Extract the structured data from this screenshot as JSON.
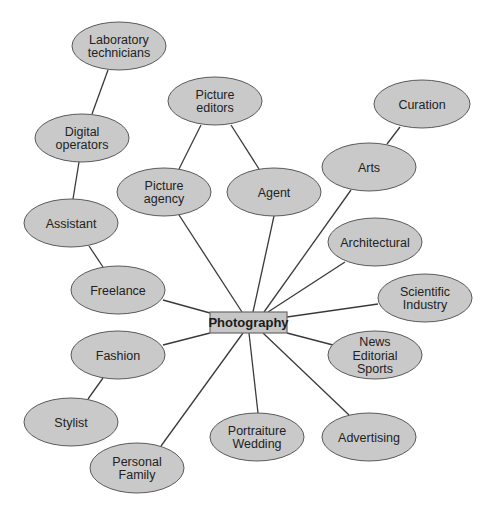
{
  "diagram": {
    "title_visible": "",
    "colors": {
      "node_fill": "#c9c9c9",
      "node_stroke": "#5a5a5a",
      "edge": "#3a3a3a",
      "center_fill": "#c6c6c6",
      "text": "#222222"
    },
    "center": {
      "id": "photography",
      "label": "Photography",
      "x": 210,
      "y": 312,
      "w": 77,
      "h": 21
    },
    "nodes": [
      {
        "id": "laboratory-technicians",
        "lines": [
          "Laboratory",
          "technicians"
        ],
        "cx": 119,
        "cy": 46,
        "rx": 47,
        "ry": 24
      },
      {
        "id": "digital-operators",
        "lines": [
          "Digital",
          "operators"
        ],
        "cx": 82,
        "cy": 138,
        "rx": 47,
        "ry": 24
      },
      {
        "id": "assistant",
        "lines": [
          "Assistant"
        ],
        "cx": 71,
        "cy": 223,
        "rx": 47,
        "ry": 24
      },
      {
        "id": "freelance",
        "lines": [
          "Freelance"
        ],
        "cx": 118,
        "cy": 290,
        "rx": 47,
        "ry": 24
      },
      {
        "id": "picture-editors",
        "lines": [
          "Picture",
          "editors"
        ],
        "cx": 215,
        "cy": 101,
        "rx": 47,
        "ry": 24
      },
      {
        "id": "picture-agency",
        "lines": [
          "Picture",
          "agency"
        ],
        "cx": 164,
        "cy": 192,
        "rx": 47,
        "ry": 24
      },
      {
        "id": "agent",
        "lines": [
          "Agent"
        ],
        "cx": 274,
        "cy": 192,
        "rx": 47,
        "ry": 24
      },
      {
        "id": "curation",
        "lines": [
          "Curation"
        ],
        "cx": 422,
        "cy": 104,
        "rx": 48,
        "ry": 24
      },
      {
        "id": "arts",
        "lines": [
          "Arts"
        ],
        "cx": 369,
        "cy": 167,
        "rx": 47,
        "ry": 24
      },
      {
        "id": "architectural",
        "lines": [
          "Architectural"
        ],
        "cx": 375,
        "cy": 242,
        "rx": 47,
        "ry": 24
      },
      {
        "id": "scientific-industry",
        "lines": [
          "Scientific",
          "Industry"
        ],
        "cx": 425,
        "cy": 298,
        "rx": 47,
        "ry": 24
      },
      {
        "id": "news-editorial-sports",
        "lines": [
          "News",
          "Editorial",
          "Sports"
        ],
        "cx": 375,
        "cy": 355,
        "rx": 47,
        "ry": 24
      },
      {
        "id": "advertising",
        "lines": [
          "Advertising"
        ],
        "cx": 369,
        "cy": 437,
        "rx": 47,
        "ry": 24
      },
      {
        "id": "portraiture-wedding",
        "lines": [
          "Portraiture",
          "Wedding"
        ],
        "cx": 257,
        "cy": 437,
        "rx": 47,
        "ry": 24
      },
      {
        "id": "personal-family",
        "lines": [
          "Personal",
          "Family"
        ],
        "cx": 137,
        "cy": 468,
        "rx": 47,
        "ry": 25
      },
      {
        "id": "fashion",
        "lines": [
          "Fashion"
        ],
        "cx": 118,
        "cy": 355,
        "rx": 47,
        "ry": 24
      },
      {
        "id": "stylist",
        "lines": [
          "Stylist"
        ],
        "cx": 71,
        "cy": 422,
        "rx": 47,
        "ry": 24
      }
    ],
    "edges": [
      {
        "from": "laboratory-technicians",
        "to": "digital-operators",
        "x1": 108,
        "y1": 70,
        "x2": 92,
        "y2": 114
      },
      {
        "from": "digital-operators",
        "to": "assistant",
        "x1": 79,
        "y1": 162,
        "x2": 73,
        "y2": 199
      },
      {
        "from": "assistant",
        "to": "freelance",
        "x1": 89,
        "y1": 246,
        "x2": 103,
        "y2": 267
      },
      {
        "from": "freelance",
        "to": "photography",
        "x1": 163,
        "y1": 300,
        "x2": 210,
        "y2": 313
      },
      {
        "from": "picture-editors",
        "to": "picture-agency",
        "x1": 201,
        "y1": 125,
        "x2": 179,
        "y2": 169
      },
      {
        "from": "picture-editors",
        "to": "agent",
        "x1": 231,
        "y1": 125,
        "x2": 259,
        "y2": 169
      },
      {
        "from": "picture-agency",
        "to": "photography",
        "x1": 179,
        "y1": 215,
        "x2": 242,
        "y2": 312
      },
      {
        "from": "agent",
        "to": "photography",
        "x1": 274,
        "y1": 216,
        "x2": 253,
        "y2": 312
      },
      {
        "from": "curation",
        "to": "arts",
        "x1": 400,
        "y1": 127,
        "x2": 387,
        "y2": 144
      },
      {
        "from": "arts",
        "to": "photography",
        "x1": 351,
        "y1": 190,
        "x2": 264,
        "y2": 312
      },
      {
        "from": "architectural",
        "to": "photography",
        "x1": 345,
        "y1": 262,
        "x2": 268,
        "y2": 312
      },
      {
        "from": "scientific-industry",
        "to": "photography",
        "x1": 378,
        "y1": 304,
        "x2": 287,
        "y2": 317
      },
      {
        "from": "news-editorial-sports",
        "to": "photography",
        "x1": 333,
        "y1": 345,
        "x2": 287,
        "y2": 333
      },
      {
        "from": "advertising",
        "to": "photography",
        "x1": 349,
        "y1": 415,
        "x2": 263,
        "y2": 333
      },
      {
        "from": "portraiture-wedding",
        "to": "photography",
        "x1": 258,
        "y1": 413,
        "x2": 249,
        "y2": 333
      },
      {
        "from": "personal-family",
        "to": "photography",
        "x1": 161,
        "y1": 446,
        "x2": 243,
        "y2": 333
      },
      {
        "from": "fashion",
        "to": "photography",
        "x1": 163,
        "y1": 345,
        "x2": 210,
        "y2": 333
      },
      {
        "from": "fashion",
        "to": "stylist",
        "x1": 103,
        "y1": 378,
        "x2": 88,
        "y2": 399
      }
    ]
  }
}
